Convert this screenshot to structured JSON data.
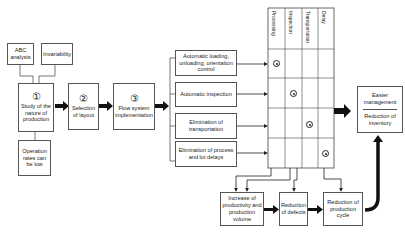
{
  "inputs": {
    "abc": "ABC analysis",
    "invariability": "Invariability"
  },
  "steps": [
    {
      "num": "①",
      "label": "Study of the nature of production"
    },
    {
      "num": "②",
      "label": "Selection of layout"
    },
    {
      "num": "③",
      "label": "Flow system implementation"
    }
  ],
  "constraint": "Operation rates can be low",
  "measures": [
    "Automatic loading, unloading, orientation control",
    "Automatic inspection",
    "Elimination of transportation",
    "Elimination of process and lot delays"
  ],
  "matrix": {
    "columns": [
      "Processing",
      "Inspection",
      "Transportation",
      "Delay"
    ],
    "marks": [
      [
        0,
        0
      ],
      [
        1,
        1
      ],
      [
        2,
        2
      ],
      [
        3,
        3
      ]
    ]
  },
  "results": {
    "top": "Easier management",
    "bottom": "Reduction of inventory"
  },
  "effects": [
    "Increase of productivity and production volume",
    "Reduction of defects",
    "Reduction of production cycle"
  ]
}
